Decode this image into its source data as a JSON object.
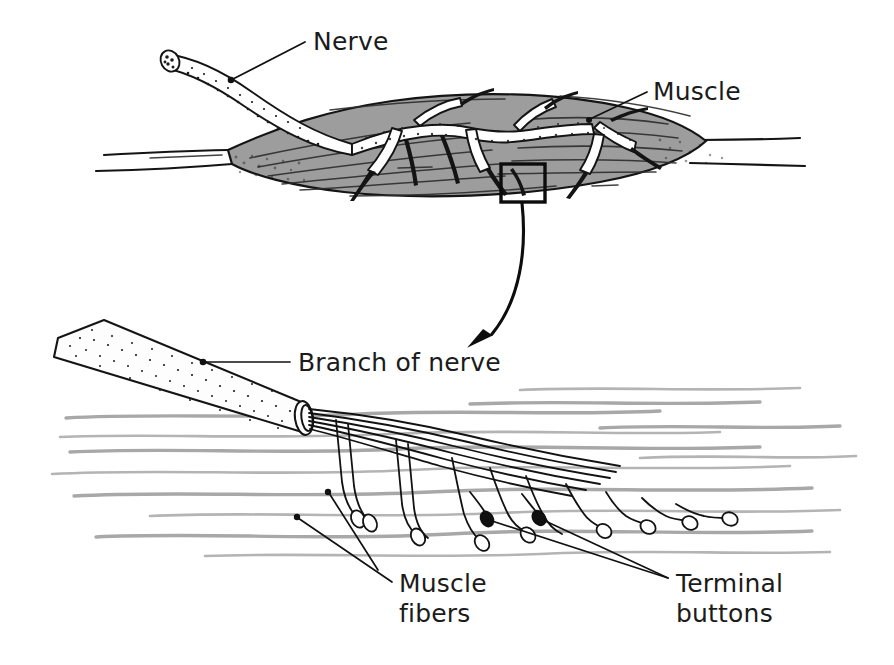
{
  "figure": {
    "background_color": "#ffffff",
    "width": 894,
    "height": 665,
    "ink_color": "#111111",
    "muscle_fill_color": "#9d9d9d",
    "fiber_color": "#a8a8a8"
  },
  "labels": {
    "nerve": "Nerve",
    "muscle": "Muscle",
    "branch_of_nerve": "Branch of nerve",
    "muscle_fibers_line1": "Muscle",
    "muscle_fibers_line2": "fibers",
    "terminal_buttons_line1": "Terminal",
    "terminal_buttons_line2": "buttons"
  },
  "panels": {
    "top": {
      "name": "whole-muscle-with-nerve",
      "description": "Spindle-shaped skeletal muscle with tendons at both ends and a branching motor nerve entering from the upper left"
    },
    "bottom": {
      "name": "magnified-neuromuscular-junction",
      "description": "Magnified view of a nerve branch splitting into axons that end in terminal buttons on muscle fibers"
    }
  },
  "callout": {
    "inset_box": {
      "x": 501,
      "y": 164,
      "width": 44,
      "height": 38
    },
    "arrow_from": {
      "x": 522,
      "y": 203
    },
    "arrow_to": {
      "x": 458,
      "y": 357
    }
  },
  "leaders": {
    "nerve": {
      "dot_x": 231,
      "dot_y": 80,
      "end_x": 305,
      "end_y": 42
    },
    "muscle": {
      "dot_x": 589,
      "dot_y": 120,
      "end_x": 645,
      "end_y": 93
    },
    "branch_of_nerve": {
      "dot_x": 203,
      "dot_y": 362,
      "end_x": 288,
      "end_y": 362
    },
    "muscle_fibers_a": {
      "dot_x": 328,
      "dot_y": 492,
      "end_x": 392,
      "end_y": 582
    },
    "muscle_fibers_b": {
      "dot_x": 297,
      "dot_y": 517,
      "end_x": 392,
      "end_y": 582
    },
    "terminal_buttons_a": {
      "dot_x": 487,
      "dot_y": 519,
      "end_x": 668,
      "end_y": 578
    },
    "terminal_buttons_b": {
      "dot_x": 539,
      "dot_y": 518,
      "end_x": 668,
      "end_y": 578
    }
  },
  "terminal_buttons": {
    "count": 11,
    "filled_count": 2
  },
  "muscle_fibers": {
    "count": 12
  }
}
